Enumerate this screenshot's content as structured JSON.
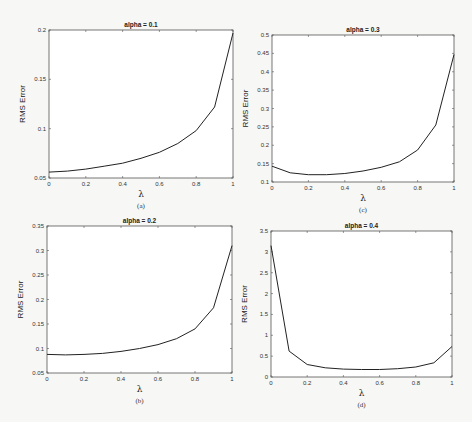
{
  "chart_data": [
    {
      "id": "a",
      "type": "line",
      "title": "alpha = 0.1",
      "caption": "(a)",
      "xlabel": "λ",
      "ylabel": "RMS Error",
      "x": [
        0,
        0.1,
        0.2,
        0.3,
        0.4,
        0.5,
        0.6,
        0.7,
        0.8,
        0.9,
        1.0
      ],
      "series": [
        {
          "name": "RMS Error",
          "values": [
            0.056,
            0.057,
            0.059,
            0.062,
            0.065,
            0.07,
            0.076,
            0.085,
            0.098,
            0.122,
            0.197
          ]
        }
      ],
      "xlim": [
        0,
        1
      ],
      "ylim": [
        0.05,
        0.2
      ],
      "xticks": [
        "0",
        "0.2",
        "0.4",
        "0.6",
        "0.8",
        "1"
      ],
      "yticks": [
        "0.05",
        "0.1",
        "0.15",
        "0.2"
      ],
      "grid": false,
      "box": {
        "left": 49,
        "top": 30,
        "right": 233,
        "bottom": 178
      }
    },
    {
      "id": "c",
      "type": "line",
      "title": "alpha = 0.3",
      "caption": "(c)",
      "xlabel": "λ",
      "ylabel": "RMS Error",
      "x": [
        0,
        0.1,
        0.2,
        0.3,
        0.4,
        0.5,
        0.6,
        0.7,
        0.8,
        0.9,
        1.0
      ],
      "series": [
        {
          "name": "RMS Error",
          "values": [
            0.143,
            0.125,
            0.12,
            0.12,
            0.123,
            0.13,
            0.14,
            0.155,
            0.187,
            0.255,
            0.447
          ]
        }
      ],
      "xlim": [
        0,
        1
      ],
      "ylim": [
        0.1,
        0.5
      ],
      "xticks": [
        "0",
        "0.2",
        "0.4",
        "0.6",
        "0.8",
        "1"
      ],
      "yticks": [
        "0.1",
        "0.15",
        "0.2",
        "0.25",
        "0.3",
        "0.35",
        "0.4",
        "0.45",
        "0.5"
      ],
      "grid": false,
      "box": {
        "left": 272,
        "top": 35,
        "right": 454,
        "bottom": 182
      }
    },
    {
      "id": "b",
      "type": "line",
      "title": "alpha = 0.2",
      "caption": "(b)",
      "xlabel": "λ",
      "ylabel": "RMS Error",
      "x": [
        0,
        0.1,
        0.2,
        0.3,
        0.4,
        0.5,
        0.6,
        0.7,
        0.8,
        0.9,
        1.0
      ],
      "series": [
        {
          "name": "RMS Error",
          "values": [
            0.088,
            0.087,
            0.088,
            0.09,
            0.094,
            0.1,
            0.108,
            0.12,
            0.14,
            0.183,
            0.31
          ]
        }
      ],
      "xlim": [
        0,
        1
      ],
      "ylim": [
        0.05,
        0.35
      ],
      "xticks": [
        "0",
        "0.2",
        "0.4",
        "0.6",
        "0.8",
        "1"
      ],
      "yticks": [
        "0.05",
        "0.1",
        "0.15",
        "0.2",
        "0.25",
        "0.3",
        "0.35"
      ],
      "grid": false,
      "box": {
        "left": 47,
        "top": 226,
        "right": 232,
        "bottom": 373
      }
    },
    {
      "id": "d",
      "type": "line",
      "title": "alpha = 0.4",
      "caption": "(d)",
      "xlabel": "λ",
      "ylabel": "RMS Error",
      "x": [
        0,
        0.1,
        0.2,
        0.3,
        0.4,
        0.5,
        0.6,
        0.7,
        0.8,
        0.9,
        1.0
      ],
      "series": [
        {
          "name": "RMS Error",
          "values": [
            3.15,
            0.62,
            0.3,
            0.22,
            0.19,
            0.18,
            0.18,
            0.2,
            0.24,
            0.34,
            0.73
          ]
        }
      ],
      "xlim": [
        0,
        1
      ],
      "ylim": [
        0,
        3.5
      ],
      "xticks": [
        "0",
        "0.2",
        "0.4",
        "0.6",
        "0.8",
        "1"
      ],
      "yticks": [
        "0",
        "0.5",
        "1",
        "1.5",
        "2",
        "2.5",
        "3",
        "3.5"
      ],
      "grid": false,
      "box": {
        "left": 271,
        "top": 231,
        "right": 452,
        "bottom": 377
      }
    }
  ]
}
